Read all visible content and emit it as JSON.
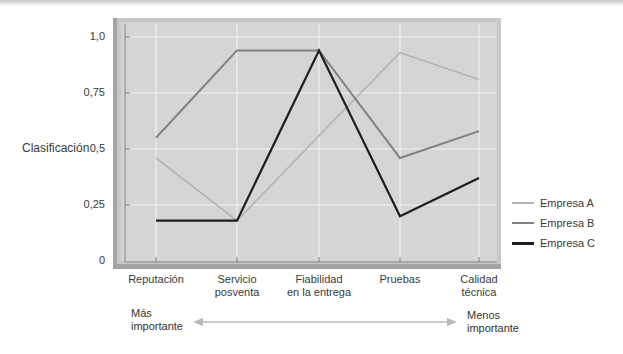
{
  "chart_data": {
    "type": "line",
    "title": "",
    "xlabel": "",
    "ylabel": "Clasificación",
    "categories": [
      "Reputación",
      "Servicio posventa",
      "Fiabilidad en la entrega",
      "Pruebas",
      "Calidad técnica"
    ],
    "category_lines": [
      [
        "Reputación"
      ],
      [
        "Servicio",
        "posventa"
      ],
      [
        "Fiabilidad",
        "en la entrega"
      ],
      [
        "Pruebas"
      ],
      [
        "Calidad",
        "técnica"
      ]
    ],
    "y_ticks": [
      "0",
      "0,25",
      "0,5",
      "0,75",
      "1,0"
    ],
    "y_tick_values": [
      0,
      0.25,
      0.5,
      0.75,
      1.0
    ],
    "ylim": [
      0,
      1.0
    ],
    "grid": true,
    "legend_position": "right",
    "series": [
      {
        "name": "Empresa A",
        "color": "#b4b4b4",
        "values": [
          0.46,
          0.18,
          0.56,
          0.93,
          0.81
        ]
      },
      {
        "name": "Empresa B",
        "color": "#808080",
        "values": [
          0.55,
          0.94,
          0.94,
          0.46,
          0.58
        ]
      },
      {
        "name": "Empresa C",
        "color": "#1e1e1e",
        "values": [
          0.18,
          0.18,
          0.94,
          0.2,
          0.37
        ]
      }
    ],
    "annotations": {
      "left": [
        "Más",
        "importante"
      ],
      "right": [
        "Menos",
        "importante"
      ],
      "arrow": "double-headed horizontal arrow between 'Más importante' and 'Menos importante'"
    }
  },
  "legend": {
    "items": [
      {
        "label": "Empresa A",
        "color": "#b4b4b4"
      },
      {
        "label": "Empresa B",
        "color": "#808080"
      },
      {
        "label": "Empresa C",
        "color": "#1e1e1e"
      }
    ]
  },
  "axis": {
    "ylabel": "Clasificación",
    "yticks": [
      "1,0",
      "0,75",
      "0,5",
      "0,25",
      "0"
    ],
    "xticks": [
      {
        "line1": "Reputación",
        "line2": ""
      },
      {
        "line1": "Servicio",
        "line2": "posventa"
      },
      {
        "line1": "Fiabilidad",
        "line2": "en la entrega"
      },
      {
        "line1": "Pruebas",
        "line2": ""
      },
      {
        "line1": "Calidad",
        "line2": "técnica"
      }
    ]
  },
  "importance": {
    "left_line1": "Más",
    "left_line2": "importante",
    "right_line1": "Menos",
    "right_line2": "importante"
  },
  "colors": {
    "plot_bg": "#d5d5d5",
    "frame": "#a0a0a0",
    "grid": "#f4f4f4",
    "arrow": "#b8b8b8"
  }
}
